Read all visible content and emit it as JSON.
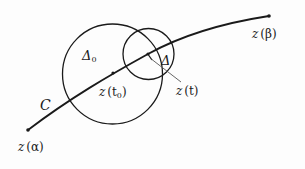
{
  "diagram": {
    "curve": {
      "name": "C",
      "start_label": "z(α)",
      "end_label": "z(β)"
    },
    "points": {
      "t0_label": "z(t₀)",
      "t_label": "z(t)"
    },
    "regions": {
      "big_disk_label": "Δ₀",
      "small_disk_label": "Δ"
    },
    "labels": {
      "z_alpha_z": "z",
      "z_alpha_arg": "(α)",
      "z_beta_z": "z",
      "z_beta_arg": "(β)",
      "z_t0_z": "z",
      "z_t0_arg": "(t",
      "z_t0_sub": "0",
      "z_t0_close": ")",
      "z_t_z": "z",
      "z_t_arg": "(t)",
      "C": "C",
      "delta0_main": "Δ",
      "delta0_sub": "0",
      "delta": "Δ"
    },
    "colors": {
      "ink": "#1a1a1a",
      "leader": "#555555",
      "background": "#fdfdfd"
    }
  }
}
